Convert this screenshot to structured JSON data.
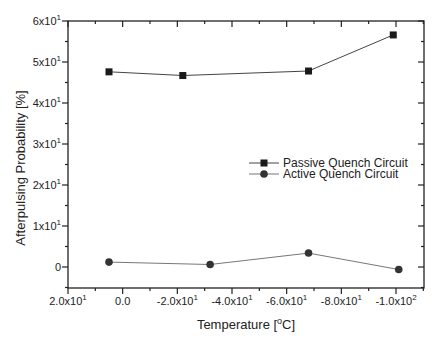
{
  "chart_data": {
    "type": "line",
    "title": "",
    "xlabel": "Temperature [°C]",
    "xlabel_parts": {
      "pre": "Temperature [",
      "sup": "o",
      "post": "C]"
    },
    "ylabel": "Afterpulsing Probability [%]",
    "xlim": [
      20,
      -110.6
    ],
    "ylim": [
      -5,
      60
    ],
    "x_ticks": [
      {
        "value": 20,
        "label": "2.0x10",
        "exp": "1"
      },
      {
        "value": 0,
        "label": "0.0",
        "exp": ""
      },
      {
        "value": -20,
        "label": "-2.0x10",
        "exp": "1"
      },
      {
        "value": -40,
        "label": "-4.0x10",
        "exp": "1"
      },
      {
        "value": -60,
        "label": "-6.0x10",
        "exp": "1"
      },
      {
        "value": -80,
        "label": "-8.0x10",
        "exp": "1"
      },
      {
        "value": -100,
        "label": "-1.0x10",
        "exp": "2"
      }
    ],
    "y_ticks": [
      {
        "value": 0,
        "label": "0",
        "exp": ""
      },
      {
        "value": 10,
        "label": "1x10",
        "exp": "1"
      },
      {
        "value": 20,
        "label": "2x10",
        "exp": "1"
      },
      {
        "value": 30,
        "label": "3x10",
        "exp": "1"
      },
      {
        "value": 40,
        "label": "4x10",
        "exp": "1"
      },
      {
        "value": 50,
        "label": "5x10",
        "exp": "1"
      },
      {
        "value": 60,
        "label": "6x10",
        "exp": "1"
      }
    ],
    "grid": false,
    "legend_position": "center-right",
    "series": [
      {
        "name": "Passive Quench Circuit",
        "marker": "square",
        "color": "#1a1a1a",
        "line_color": "#444444",
        "x": [
          5,
          -22,
          -68,
          -99
        ],
        "y": [
          47.6,
          46.7,
          47.8,
          56.6
        ]
      },
      {
        "name": "Active Quench Circuit",
        "marker": "circle",
        "color": "#333333",
        "line_color": "#777777",
        "x": [
          5,
          -32,
          -68,
          -101
        ],
        "y": [
          1.2,
          0.6,
          3.4,
          -0.6
        ]
      }
    ]
  }
}
